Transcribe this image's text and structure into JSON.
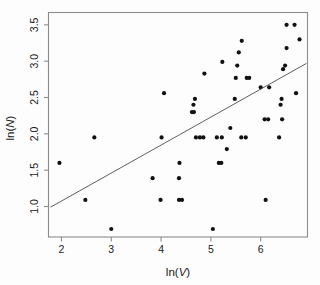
{
  "chart_data": {
    "type": "scatter",
    "title": "",
    "xlabel": "ln(V)",
    "ylabel": "ln(N)",
    "xlim": [
      1.74,
      6.94
    ],
    "ylim": [
      0.58,
      3.67
    ],
    "xticks": [
      2,
      3,
      4,
      5,
      6
    ],
    "yticks": [
      1.0,
      1.5,
      2.0,
      2.5,
      3.0,
      3.5
    ],
    "xtick_labels": [
      "2",
      "3",
      "4",
      "5",
      "6"
    ],
    "ytick_labels": [
      "1.0",
      "1.5",
      "2.0",
      "2.5",
      "3.0",
      "3.5"
    ],
    "grid": false,
    "legend": null,
    "point_color": "#111111",
    "line_color": "#4d4d4d",
    "frame_color": "#8c8c8c",
    "series": [
      {
        "name": "observations",
        "marker": "filled-circle",
        "points": [
          [
            1.96,
            1.6
          ],
          [
            2.48,
            1.09
          ],
          [
            2.66,
            1.95
          ],
          [
            3.0,
            0.69
          ],
          [
            3.83,
            1.39
          ],
          [
            3.99,
            1.09
          ],
          [
            4.01,
            1.95
          ],
          [
            4.06,
            2.56
          ],
          [
            4.36,
            1.09
          ],
          [
            4.42,
            1.09
          ],
          [
            4.36,
            1.39
          ],
          [
            4.37,
            1.6
          ],
          [
            4.62,
            2.3
          ],
          [
            4.66,
            2.3
          ],
          [
            4.65,
            2.4
          ],
          [
            4.68,
            2.48
          ],
          [
            4.7,
            1.95
          ],
          [
            4.78,
            1.95
          ],
          [
            4.85,
            1.95
          ],
          [
            4.87,
            2.83
          ],
          [
            5.04,
            0.69
          ],
          [
            5.12,
            1.95
          ],
          [
            5.16,
            1.6
          ],
          [
            5.21,
            1.6
          ],
          [
            5.22,
            1.95
          ],
          [
            5.23,
            2.99
          ],
          [
            5.32,
            1.79
          ],
          [
            5.39,
            2.08
          ],
          [
            5.48,
            2.48
          ],
          [
            5.5,
            2.77
          ],
          [
            5.53,
            2.94
          ],
          [
            5.56,
            3.12
          ],
          [
            5.61,
            1.95
          ],
          [
            5.62,
            3.28
          ],
          [
            5.7,
            1.95
          ],
          [
            5.72,
            2.77
          ],
          [
            5.77,
            2.77
          ],
          [
            6.0,
            2.64
          ],
          [
            6.08,
            2.2
          ],
          [
            6.1,
            1.09
          ],
          [
            6.15,
            2.2
          ],
          [
            6.17,
            2.64
          ],
          [
            6.37,
            1.95
          ],
          [
            6.4,
            2.4
          ],
          [
            6.42,
            2.48
          ],
          [
            6.43,
            2.2
          ],
          [
            6.45,
            2.89
          ],
          [
            6.49,
            2.94
          ],
          [
            6.52,
            3.18
          ],
          [
            6.52,
            3.5
          ],
          [
            6.68,
            3.5
          ],
          [
            6.71,
            2.56
          ],
          [
            6.78,
            3.3
          ]
        ]
      }
    ],
    "fit_line": {
      "name": "least-squares fit",
      "x0": 1.78,
      "y0": 0.99,
      "x1": 6.92,
      "y1": 2.97
    }
  }
}
